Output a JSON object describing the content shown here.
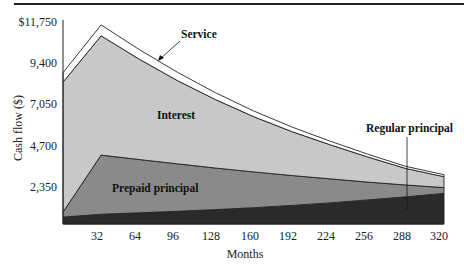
{
  "chart_data": {
    "type": "area",
    "title": "",
    "xlabel": "Months",
    "ylabel": "Cash flow ($)",
    "x": [
      0,
      32,
      64,
      96,
      128,
      160,
      192,
      224,
      256,
      288,
      320
    ],
    "xticks": [
      "32",
      "64",
      "96",
      "128",
      "160",
      "192",
      "224",
      "256",
      "288",
      "320"
    ],
    "yticks": [
      "2,350",
      "4,700",
      "7,050",
      "9,400",
      "$11,750"
    ],
    "ytick_values": [
      2350,
      4700,
      7050,
      9400,
      11750
    ],
    "xlim": [
      0,
      320
    ],
    "ylim": [
      0,
      11750
    ],
    "grid": false,
    "stacked": true,
    "series": [
      {
        "name": "Regular principal",
        "values": [
          400,
          570,
          650,
          740,
          840,
          950,
          1080,
          1230,
          1400,
          1580,
          1780
        ],
        "color": "#2a2a2a"
      },
      {
        "name": "Prepaid principal",
        "values": [
          290,
          3440,
          3100,
          2760,
          2420,
          2080,
          1740,
          1400,
          1040,
          690,
          340
        ],
        "color": "#8a8a8a"
      },
      {
        "name": "Interest",
        "values": [
          7560,
          6940,
          5840,
          4850,
          3980,
          3220,
          2560,
          1990,
          1460,
          960,
          630
        ],
        "color": "#c8c8c8"
      },
      {
        "name": "Service",
        "values": [
          550,
          630,
          560,
          480,
          400,
          330,
          270,
          210,
          160,
          120,
          120
        ],
        "color": "#ffffff"
      }
    ],
    "annotations": [
      {
        "text": "Service",
        "points_to": "service band near month 96"
      },
      {
        "text": "Interest",
        "position": "inside interest area near month 96"
      },
      {
        "text": "Prepaid principal",
        "position": "inside prepaid area near month 96"
      },
      {
        "text": "Regular principal",
        "points_to": "regular principal band near month 288"
      }
    ]
  },
  "labels": {
    "y_axis_title": "Cash flow ($)",
    "x_axis_title": "Months",
    "service": "Service",
    "interest": "Interest",
    "prepaid": "Prepaid principal",
    "regular": "Regular principal",
    "yticks": [
      "$11,750",
      "9,400",
      "7,050",
      "4,700",
      "2,350"
    ],
    "xticks": [
      "32",
      "64",
      "96",
      "128",
      "160",
      "192",
      "224",
      "256",
      "288",
      "320"
    ]
  }
}
